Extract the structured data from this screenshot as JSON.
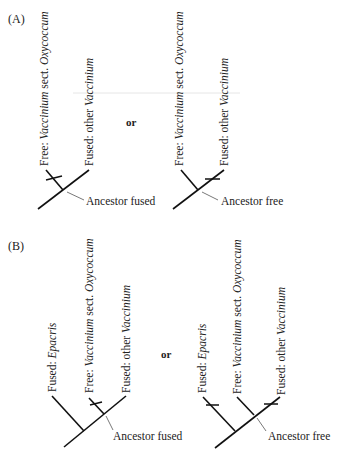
{
  "figure": {
    "panels": [
      {
        "label": "(A)",
        "connector": "or",
        "trees": [
          {
            "taxa": [
              {
                "state": "Free: ",
                "name": "Vaccinium",
                "rest": " sect. ",
                "name2": "Oxycoccum"
              },
              {
                "state": "Fused: other ",
                "name": "Vaccinium"
              }
            ],
            "ancestor_label": "Ancestor fused",
            "change_marked_on": "Free: Vaccinium sect. Oxycoccum"
          },
          {
            "taxa": [
              {
                "state": "Free: ",
                "name": "Vaccinium",
                "rest": " sect. ",
                "name2": "Oxycoccum"
              },
              {
                "state": "Fused: other ",
                "name": "Vaccinium"
              }
            ],
            "ancestor_label": "Ancestor free",
            "change_marked_on": "Fused: other Vaccinium"
          }
        ]
      },
      {
        "label": "(B)",
        "connector": "or",
        "trees": [
          {
            "taxa": [
              {
                "state": "Fused: ",
                "name": "Epacris"
              },
              {
                "state": "Free: ",
                "name": "Vaccinium",
                "rest": " sect. ",
                "name2": "Oxycoccum"
              },
              {
                "state": "Fused: other ",
                "name": "Vaccinium"
              }
            ],
            "ancestor_label": "Ancestor fused",
            "change_marked_on": "Free: Vaccinium sect. Oxycoccum"
          },
          {
            "taxa": [
              {
                "state": "Fused: ",
                "name": "Epacris"
              },
              {
                "state": "Free: ",
                "name": "Vaccinium",
                "rest": " sect. ",
                "name2": "Oxycoccum"
              },
              {
                "state": "Fused: other ",
                "name": "Vaccinium"
              }
            ],
            "ancestor_label": "Ancestor free",
            "change_marked_on": [
              "Fused: Epacris",
              "Fused: other Vaccinium"
            ]
          }
        ]
      }
    ]
  }
}
